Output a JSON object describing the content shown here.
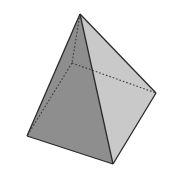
{
  "diagram": {
    "faces": [
      {
        "name": "left-face",
        "color": "#8e8e8e"
      },
      {
        "name": "right-face",
        "color": "#c9c9c9"
      }
    ],
    "edge_color": "#2a2a2a",
    "hidden_edge_style": "dotted",
    "background": "#ffffff"
  }
}
